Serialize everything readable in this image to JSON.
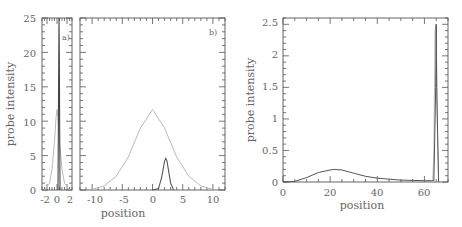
{
  "chart_data": [
    {
      "id": "a",
      "type": "line",
      "panel_label": "a)",
      "xlabel": "",
      "ylabel": "probe intensity",
      "xlim": [
        -3,
        3
      ],
      "ylim": [
        0,
        25
      ],
      "xticks": [
        "-2",
        "0",
        "2"
      ],
      "yticks": [
        "0",
        "5",
        "10",
        "15",
        "20",
        "25"
      ],
      "series": [
        {
          "name": "wide",
          "color": "#bbbbbb",
          "x": [
            -2.5,
            -1.5,
            -1,
            -0.5,
            -0.2,
            0,
            0.2,
            0.5,
            1,
            1.5,
            2.5
          ],
          "y": [
            0,
            1,
            3,
            7,
            10.5,
            11.7,
            10.5,
            7,
            3,
            1,
            0
          ]
        },
        {
          "name": "narrow",
          "color": "#444444",
          "x": [
            0.2,
            0.35,
            0.4,
            0.45,
            0.6
          ],
          "y": [
            0,
            20,
            25,
            20,
            0
          ]
        }
      ]
    },
    {
      "id": "b",
      "type": "line",
      "panel_label": "b)",
      "xlabel": "position",
      "ylabel": "",
      "xlim": [
        -12,
        12
      ],
      "ylim": [
        0,
        25
      ],
      "xticks": [
        "-10",
        "-5",
        "0",
        "5",
        "10"
      ],
      "series": [
        {
          "name": "wide",
          "color": "#bbbbbb",
          "x": [
            -10,
            -8,
            -6,
            -4,
            -2,
            0,
            2,
            4,
            6,
            8,
            10
          ],
          "y": [
            0.1,
            0.6,
            2.0,
            4.8,
            9.0,
            11.7,
            9.0,
            4.8,
            2.0,
            0.6,
            0.1
          ]
        },
        {
          "name": "narrow",
          "color": "#555555",
          "x": [
            0,
            1,
            1.5,
            2,
            2.2,
            2.4,
            3,
            3.5
          ],
          "y": [
            0,
            0.2,
            1.8,
            4.2,
            4.6,
            4.2,
            1.0,
            0
          ]
        }
      ]
    },
    {
      "id": "c",
      "type": "line",
      "panel_label": "",
      "xlabel": "position",
      "ylabel": "probe intensity",
      "xlim": [
        0,
        70
      ],
      "ylim": [
        0,
        2.6
      ],
      "xticks": [
        "0",
        "20",
        "40",
        "60"
      ],
      "yticks": [
        "0",
        "0.5",
        "1",
        "1.5",
        "2",
        "2.5"
      ],
      "series": [
        {
          "name": "dark",
          "color": "#555555",
          "x": [
            0,
            5,
            10,
            15,
            20,
            22,
            25,
            30,
            35,
            40,
            50,
            60,
            64,
            64.8,
            65,
            65.2,
            66
          ],
          "y": [
            0,
            0.01,
            0.07,
            0.15,
            0.19,
            0.2,
            0.19,
            0.14,
            0.09,
            0.06,
            0.03,
            0.02,
            0.02,
            1.5,
            2.5,
            1.5,
            0
          ]
        },
        {
          "name": "light",
          "color": "#bbbbbb",
          "x": [
            63.5,
            64,
            64.5,
            65,
            65.5,
            66
          ],
          "y": [
            0,
            0.5,
            2.4,
            2.5,
            0.8,
            0
          ]
        }
      ]
    }
  ],
  "labels": {
    "panel_a": "a)",
    "panel_b": "b)",
    "ylabel_left": "probe intensity",
    "ylabel_right": "probe intensity",
    "xlabel_middle": "position",
    "xlabel_right": "position",
    "a_yticks": [
      "0",
      "5",
      "10",
      "15",
      "20",
      "25"
    ],
    "a_xticks": [
      "-2",
      "0",
      "2"
    ],
    "b_xticks": [
      "-10",
      "-5",
      "0",
      "5",
      "10"
    ],
    "c_yticks": [
      "0",
      "0.5",
      "1",
      "1.5",
      "2",
      "2.5"
    ],
    "c_xticks": [
      "0",
      "20",
      "40",
      "60"
    ]
  }
}
